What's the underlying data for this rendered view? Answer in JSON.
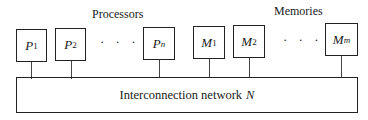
{
  "diagram": {
    "processors_label": "Processors",
    "memories_label": "Memories",
    "processors": [
      {
        "base": "P",
        "sub": "1",
        "sub_italic": false
      },
      {
        "base": "P",
        "sub": "2",
        "sub_italic": false
      },
      {
        "base": "P",
        "sub": "n",
        "sub_italic": true
      }
    ],
    "memories": [
      {
        "base": "M",
        "sub": "1",
        "sub_italic": false
      },
      {
        "base": "M",
        "sub": "2",
        "sub_italic": false
      },
      {
        "base": "M",
        "sub": "m",
        "sub_italic": true
      }
    ],
    "ellipsis": "· · ·",
    "bus": {
      "label": "Interconnection network",
      "symbol": "N"
    }
  }
}
